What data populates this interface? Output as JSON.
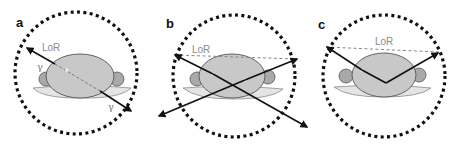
{
  "figure": {
    "panels": [
      {
        "id": "a",
        "label": "a",
        "lor_label": "LoR",
        "gamma_labels": [
          "γ",
          "γ"
        ],
        "description": "True coincidence: two 511 keV photons emitted back-to-back along the line of response"
      },
      {
        "id": "b",
        "label": "b",
        "lor_label": "LoR",
        "description": "Random coincidence: photons from two separate annihilations detected simultaneously; assigned LoR is incorrect"
      },
      {
        "id": "c",
        "label": "c",
        "lor_label": "LoR",
        "description": "Scattered coincidence: one photon is Compton scattered inside the body; assigned LoR is displaced"
      }
    ],
    "colors": {
      "detector_ring": "#111111",
      "body_fill": "#c8c8c8",
      "body_stroke": "#555555",
      "arm_fill": "#a9a9a9",
      "bed_fill": "#e4e4e4",
      "bed_stroke": "#8a8a8a",
      "arrow": "#111111",
      "lor_dashed": "#8a8a8a",
      "label_text": "#8a8a8a"
    }
  }
}
